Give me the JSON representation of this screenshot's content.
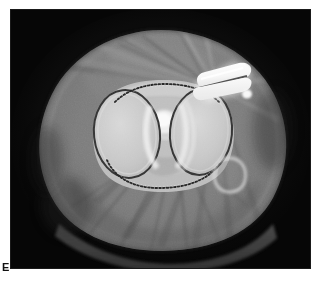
{
  "figure": {
    "panel_letter": "E",
    "modality": "CT",
    "plane": "axial",
    "body_part": "knee",
    "frame": {
      "x": 11,
      "y": 10,
      "width": 299,
      "height": 258
    },
    "canvas_size": {
      "width": 320,
      "height": 286
    }
  },
  "colors": {
    "page_background": "#ffffff",
    "air_background": "#060606",
    "frame_border": "#1a1a1a",
    "soft_tissue_outer": "#6a6a6a",
    "soft_tissue_mid": "#7b7b7b",
    "muscle_dark": "#5c5c5c",
    "fat_layer": "#888888",
    "bone_cancellous": "#c9c9c9",
    "bone_cortex_dark": "#2e2e2e",
    "bone_bright": "#e6e6e6",
    "metal_implant": "#fdfdfd",
    "metal_implant_shade": "#e2e2e2",
    "streak_light": "#9a9a9a",
    "streak_dark": "#3f3f3f",
    "table_pad": "#484848",
    "label_text": "#111111"
  },
  "scan": {
    "label": "axial-ct-knee-slice",
    "background_label": "air-background",
    "soft_tissue": {
      "label": "soft-tissue-silhouette",
      "center_x": 150,
      "center_y": 132,
      "radius_x": 128,
      "radius_y": 112
    },
    "subcutaneous_fat": {
      "label": "subcutaneous-fat-rim",
      "thickness": 9
    },
    "structures": [
      {
        "id": "lateral-femoral-condyle",
        "label": "Lateral femoral condyle",
        "shape": "ellipse",
        "cx": 116,
        "cy": 124,
        "rx": 33,
        "ry": 44,
        "rotation": -6,
        "fill": "#c9c9c9",
        "rim": "#2c2c2c"
      },
      {
        "id": "medial-femoral-condyle",
        "label": "Medial femoral condyle",
        "shape": "ellipse",
        "cx": 190,
        "cy": 122,
        "rx": 31,
        "ry": 43,
        "rotation": 5,
        "fill": "#c9c9c9",
        "rim": "#2c2c2c"
      },
      {
        "id": "intercondylar-notch",
        "label": "Intercondylar notch",
        "cx": 152,
        "cy": 122,
        "fill": "#b4b4b4"
      },
      {
        "id": "central-bright-focus",
        "label": "Central sclerotic focus",
        "cx": 153,
        "cy": 112,
        "rx": 13,
        "ry": 11,
        "fill": "#efefef"
      },
      {
        "id": "anterior-trochlear-contour",
        "label": "Anterior trochlear dotted contour",
        "style": "dotted"
      },
      {
        "id": "posterior-condylar-contour",
        "label": "Posterior condylar dotted contour",
        "style": "dotted"
      },
      {
        "id": "fibular-head-ring",
        "label": "Small cortical ring structure",
        "cx": 218,
        "cy": 163,
        "rx": 15,
        "ry": 16,
        "stroke": "#d2d2d2"
      }
    ],
    "implant": {
      "id": "metallic-implant",
      "label": "Metallic hardware / implant",
      "blocks": [
        {
          "id": "implant-upper-block",
          "label": "Upper implant block",
          "fill": "#fdfdfd"
        },
        {
          "id": "implant-lower-wedge",
          "label": "Lower implant wedge",
          "fill": "#f4f4f4"
        }
      ],
      "position": {
        "x": 178,
        "y": 55,
        "width": 58,
        "height": 35
      }
    },
    "artifacts": {
      "id": "metal-streak-artifact",
      "label": "Beam-hardening streak artifact",
      "origin_x": 205,
      "origin_y": 78,
      "ray_count": 16
    },
    "table_pad": {
      "id": "positioning-pad",
      "label": "Posterior positioning pad",
      "fill": "#484848"
    }
  }
}
